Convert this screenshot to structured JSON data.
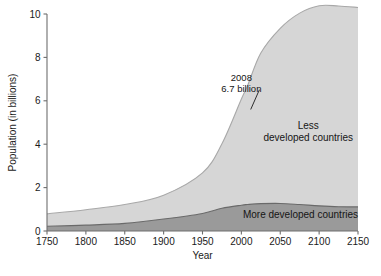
{
  "chart_data": {
    "type": "area",
    "title": "",
    "subtitle": "",
    "xlabel": "Year",
    "ylabel": "Population (in billions)",
    "xlim": [
      1750,
      2150
    ],
    "ylim": [
      0,
      10
    ],
    "grid": false,
    "legend_position": "inline-labels",
    "stacked": true,
    "x": [
      1750,
      1800,
      1850,
      1900,
      1950,
      1975,
      2000,
      2008,
      2025,
      2050,
      2075,
      2100,
      2125,
      2150
    ],
    "series": [
      {
        "name": "More developed countries",
        "color": "#9a9a9a",
        "values": [
          0.22,
          0.27,
          0.35,
          0.55,
          0.81,
          1.05,
          1.19,
          1.22,
          1.26,
          1.27,
          1.22,
          1.16,
          1.12,
          1.11
        ]
      },
      {
        "name": "Less developed countries",
        "color": "#d6d6d6",
        "values": [
          0.57,
          0.71,
          0.87,
          1.1,
          1.87,
          2.97,
          4.89,
          5.48,
          6.94,
          8.07,
          8.82,
          9.22,
          9.25,
          9.19
        ]
      }
    ],
    "total_values": [
      0.79,
      0.98,
      1.22,
      1.65,
      2.68,
      4.02,
      6.08,
      6.7,
      8.2,
      9.34,
      10.04,
      10.38,
      10.37,
      10.3
    ],
    "xticks": [
      1750,
      1800,
      1850,
      1900,
      1950,
      2000,
      2050,
      2100,
      2150
    ],
    "xtick_labels": [
      "1750",
      "1800",
      "1850",
      "1900",
      "1950",
      "2000",
      "2050",
      "2100",
      "2150"
    ],
    "yticks": [
      0,
      2,
      4,
      6,
      8,
      10
    ],
    "ytick_labels": [
      "0",
      "2",
      "4",
      "6",
      "8",
      "10"
    ],
    "annotations": [
      {
        "name": "population-2008",
        "line1": "2008",
        "line2": "6.7 billion",
        "text_x": 2000,
        "text_y": 6.9,
        "point_x": 2012,
        "point_y": 5.6
      }
    ],
    "series_labels": [
      {
        "name": "less-developed-countries",
        "line1": "Less",
        "line2": "developed countries",
        "x": 2086,
        "y": 4.7
      },
      {
        "name": "more-developed-countries",
        "line1": "More developed countries",
        "line2": "",
        "x": 2076,
        "y": 0.62
      }
    ],
    "colors": {
      "less_developed_fill": "#d6d6d6",
      "more_developed_fill": "#9a9a9a",
      "less_developed_stroke": "#a8a8a8",
      "more_developed_stroke": "#6a6a6a",
      "axis": "#6e6e6e",
      "text": "#1a1a1a",
      "background": "#ffffff"
    }
  }
}
